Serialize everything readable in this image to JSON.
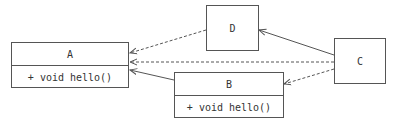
{
  "diagram": {
    "type": "uml-class-diagram",
    "nodes": [
      {
        "id": "A",
        "name": "A",
        "members": [
          "+ void hello()"
        ]
      },
      {
        "id": "B",
        "name": "B",
        "members": [
          "+ void hello()"
        ]
      },
      {
        "id": "C",
        "name": "C",
        "members": []
      },
      {
        "id": "D",
        "name": "D",
        "members": []
      }
    ],
    "edges": [
      {
        "from": "D",
        "to": "A",
        "style": "dashed",
        "arrow": "open"
      },
      {
        "from": "C",
        "to": "A",
        "style": "dashed",
        "arrow": "open"
      },
      {
        "from": "B",
        "to": "A",
        "style": "solid",
        "arrow": "open"
      },
      {
        "from": "C",
        "to": "D",
        "style": "solid",
        "arrow": "open"
      },
      {
        "from": "C",
        "to": "B",
        "style": "dashed",
        "arrow": "open"
      }
    ]
  },
  "colors": {
    "line": "#555555",
    "text": "#333333",
    "background": "#ffffff"
  }
}
